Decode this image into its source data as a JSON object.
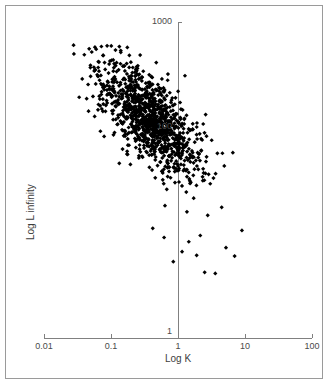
{
  "chart_data": {
    "type": "scatter",
    "title": "",
    "xlabel": "Log K",
    "ylabel": "Log L infinity",
    "xscale": "log",
    "yscale": "log",
    "xlim": [
      0.01,
      100
    ],
    "ylim": [
      1,
      1000
    ],
    "xticks": [
      0.01,
      0.1,
      1,
      10,
      100
    ],
    "xtick_labels": [
      "0.01",
      "0.1",
      "1",
      "10",
      "100"
    ],
    "yticks": [
      1,
      100,
      1000
    ],
    "ytick_labels": [
      "1",
      "100",
      "1000"
    ],
    "grid": false,
    "legend": null,
    "marker": "diamond",
    "marker_color": "#000000",
    "marker_size_px": 4,
    "n_points": 1120,
    "relationship": "negative correlation between Log K and Log L infinity",
    "x_data_range": [
      0.028,
      13.5
    ],
    "y_data_range": [
      3.2,
      620
    ],
    "dense_core": {
      "x": [
        0.15,
        1.6
      ],
      "y": [
        55,
        210
      ]
    },
    "series": [
      {
        "name": "observations",
        "color": "#000000",
        "points_summary": "approximately 1120 (K, L-infinity) pairs following L_inf ~ K^-0.55 with scatter"
      }
    ]
  },
  "axis": {
    "x_label": "Log K",
    "y_label": "Log L infinity",
    "x_ticks": [
      "0.01",
      "0.1",
      "1",
      "10",
      "100"
    ],
    "y_ticks": [
      "1000",
      "100",
      "1"
    ]
  },
  "colors": {
    "marker": "#000000",
    "axis_line": "#808080",
    "tick_text": "#4a4a4a",
    "frame": "#9a9a9a",
    "background": "#ffffff"
  }
}
